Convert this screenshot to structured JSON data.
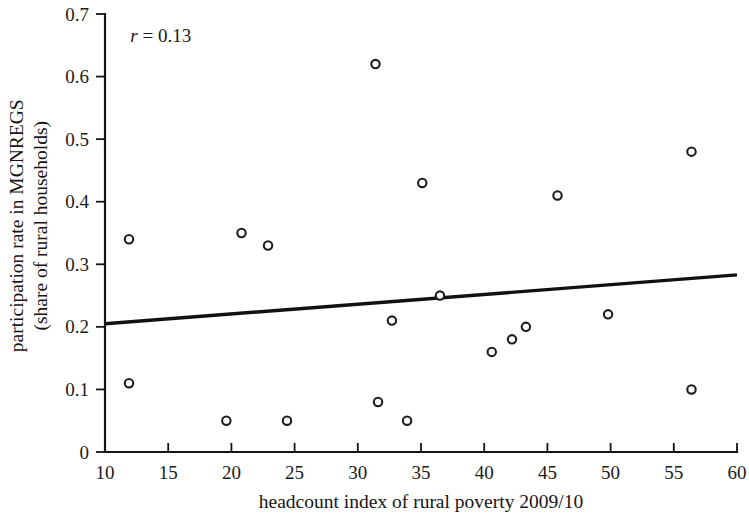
{
  "chart_data": {
    "type": "scatter",
    "title": "",
    "xlabel": "headcount index of rural poverty 2009/10",
    "ylabel_line1": "participation rate in MGNREGS",
    "ylabel_line2": "(share of rural households)",
    "xlim": [
      10,
      60
    ],
    "ylim": [
      0,
      0.7
    ],
    "xticks": [
      10,
      15,
      20,
      25,
      30,
      35,
      40,
      45,
      50,
      55,
      60
    ],
    "xtick_labels": [
      "10",
      "15",
      "20",
      "25",
      "30",
      "35",
      "40",
      "45",
      "50",
      "55",
      "60"
    ],
    "yticks": [
      0,
      0.1,
      0.2,
      0.3,
      0.4,
      0.5,
      0.6,
      0.7
    ],
    "ytick_labels": [
      "0",
      "0.1",
      "0.2",
      "0.3",
      "0.4",
      "0.5",
      "0.6",
      "0.7"
    ],
    "grid": false,
    "legend": false,
    "marker_style": "open-circle",
    "annotation": {
      "text": "r = 0.13",
      "symbol": "r",
      "operator": "=",
      "value": "0.13",
      "x": 12.0,
      "y": 0.665
    },
    "points": [
      {
        "x": 11.9,
        "y": 0.34
      },
      {
        "x": 11.9,
        "y": 0.11
      },
      {
        "x": 19.6,
        "y": 0.05
      },
      {
        "x": 20.8,
        "y": 0.35
      },
      {
        "x": 22.9,
        "y": 0.33
      },
      {
        "x": 24.4,
        "y": 0.05
      },
      {
        "x": 31.4,
        "y": 0.62
      },
      {
        "x": 31.6,
        "y": 0.08
      },
      {
        "x": 32.7,
        "y": 0.21
      },
      {
        "x": 33.9,
        "y": 0.05
      },
      {
        "x": 35.1,
        "y": 0.43
      },
      {
        "x": 36.5,
        "y": 0.25
      },
      {
        "x": 40.6,
        "y": 0.16
      },
      {
        "x": 42.2,
        "y": 0.18
      },
      {
        "x": 43.3,
        "y": 0.2
      },
      {
        "x": 45.8,
        "y": 0.41
      },
      {
        "x": 49.8,
        "y": 0.22
      },
      {
        "x": 56.4,
        "y": 0.48
      },
      {
        "x": 56.4,
        "y": 0.1
      }
    ],
    "trend_line": {
      "x_start": 10,
      "y_start": 0.205,
      "x_end": 60,
      "y_end": 0.283,
      "color": "#111111"
    },
    "colors": {
      "axis": "#141414",
      "marker_stroke": "#1d1d1d",
      "marker_fill": "#ffffff",
      "trend": "#111111",
      "background": "#ffffff"
    }
  }
}
